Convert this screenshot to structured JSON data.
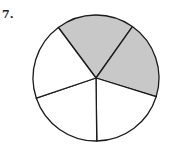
{
  "problem": {
    "number_label": "7.",
    "figure": {
      "type": "fraction-circle",
      "total_parts": 5,
      "shaded_parts": 2,
      "center": [
        96,
        78
      ],
      "radius": 63,
      "start_angle_deg": -126.7,
      "shaded_indices": [
        0,
        1
      ],
      "shade_color": "#c8c8c8",
      "stroke_color": "#1a1a1a",
      "fill_color": "#ffffff"
    }
  }
}
